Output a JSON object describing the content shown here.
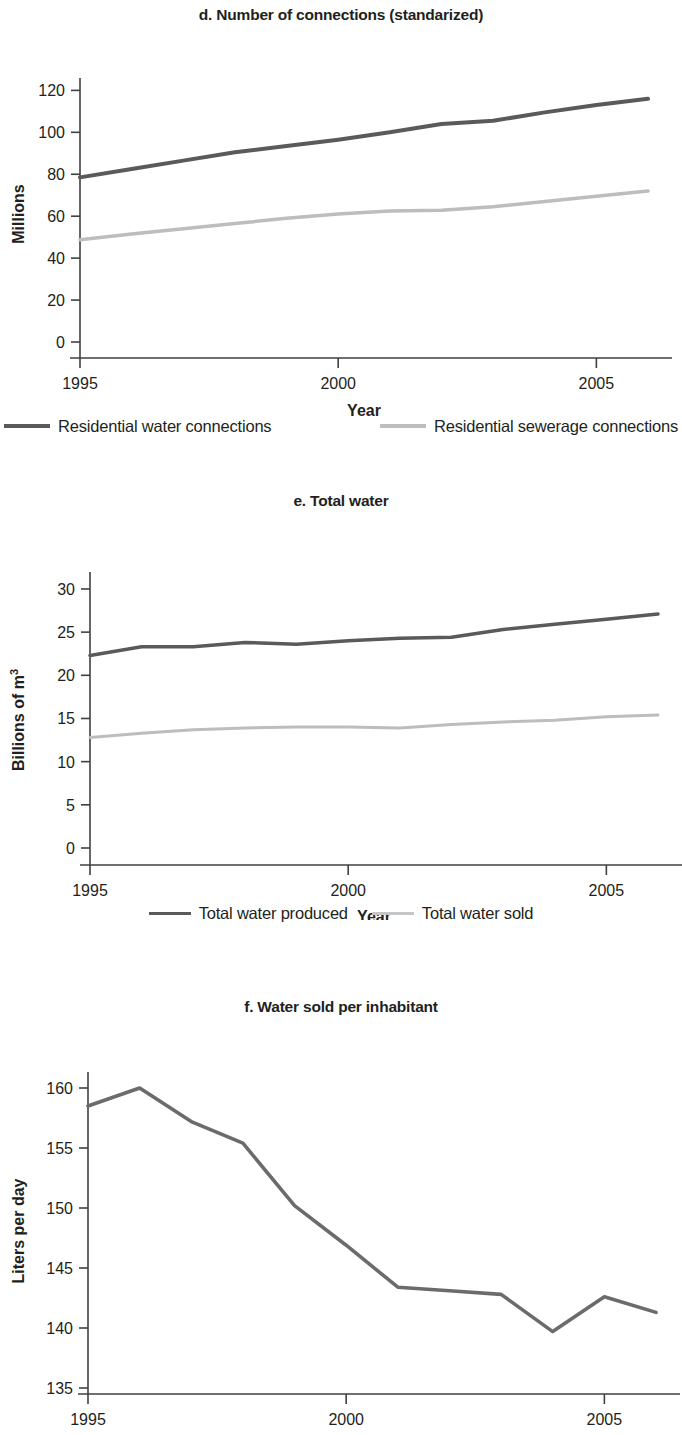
{
  "figure": {
    "shared_xlabel": "Year",
    "colors": {
      "dark": "#5a5a5a",
      "light": "#bdbdbd",
      "axis": "#404040",
      "text": "#231f20"
    }
  },
  "chart_data": [
    {
      "id": "d",
      "type": "line",
      "title": "d. Number of connections (standarized)",
      "xlabel": "Year",
      "ylabel": "Millions",
      "xlim": [
        1995,
        2006
      ],
      "ylim": [
        0,
        124
      ],
      "xticks": [
        1995,
        2000,
        2005
      ],
      "xtick_labels": [
        "1995",
        "2000",
        "2005"
      ],
      "yticks": [
        0,
        20,
        40,
        60,
        80,
        100,
        120
      ],
      "ytick_labels": [
        "0",
        "20",
        "40",
        "60",
        "80",
        "100",
        "120"
      ],
      "grid": false,
      "legend_position": "below",
      "x": [
        1995,
        1996,
        1997,
        1998,
        1999,
        2000,
        2001,
        2002,
        2003,
        2004,
        2005,
        2006
      ],
      "series": [
        {
          "name": "Residential water connections",
          "color": "#5a5a5a",
          "width": 4,
          "values": [
            78.5,
            82.5,
            86.5,
            90.5,
            93.5,
            96.5,
            100.0,
            104.0,
            105.5,
            109.5,
            113.0,
            116.0
          ]
        },
        {
          "name": "Residential sewerage connections",
          "color": "#bdbdbd",
          "width": 3.5,
          "values": [
            48.8,
            51.5,
            54.0,
            56.5,
            59.0,
            61.0,
            62.5,
            62.8,
            64.5,
            67.0,
            69.5,
            72.0
          ]
        }
      ]
    },
    {
      "id": "e",
      "type": "line",
      "title": "e. Total water",
      "xlabel": "Year",
      "ylabel": "Billions of m",
      "ylabel_superscript": "3",
      "xlim": [
        1995,
        2006
      ],
      "ylim": [
        0,
        31.5
      ],
      "xticks": [
        1995,
        2000,
        2005
      ],
      "xtick_labels": [
        "1995",
        "2000",
        "2005"
      ],
      "yticks": [
        0,
        5,
        10,
        15,
        20,
        25,
        30
      ],
      "ytick_labels": [
        "0",
        "5",
        "10",
        "15",
        "20",
        "25",
        "30"
      ],
      "grid": false,
      "legend_position": "below",
      "x": [
        1995,
        1996,
        1997,
        1998,
        1999,
        2000,
        2001,
        2002,
        2003,
        2004,
        2005,
        2006
      ],
      "series": [
        {
          "name": "Total water produced",
          "color": "#5a5a5a",
          "width": 3.5,
          "values": [
            22.3,
            23.3,
            23.3,
            23.8,
            23.6,
            24.0,
            24.3,
            24.4,
            25.3,
            25.9,
            26.5,
            27.1
          ]
        },
        {
          "name": "Total water sold",
          "color": "#bdbdbd",
          "width": 3,
          "values": [
            12.8,
            13.3,
            13.7,
            13.9,
            14.0,
            14.0,
            13.9,
            14.3,
            14.6,
            14.8,
            15.2,
            15.4
          ]
        }
      ]
    },
    {
      "id": "f",
      "type": "line",
      "title": "f. Water sold per inhabitant",
      "xlabel": "Year",
      "ylabel": "Liters per day",
      "xlim": [
        1995,
        2006
      ],
      "ylim": [
        134.5,
        161
      ],
      "xticks": [
        1995,
        2000,
        2005
      ],
      "xtick_labels": [
        "1995",
        "2000",
        "2005"
      ],
      "yticks": [
        135,
        140,
        145,
        150,
        155,
        160
      ],
      "ytick_labels": [
        "135",
        "140",
        "145",
        "150",
        "155",
        "160"
      ],
      "grid": false,
      "legend_position": "none",
      "x": [
        1995,
        1996,
        1997,
        1998,
        1999,
        2000,
        2001,
        2002,
        2003,
        2004,
        2005,
        2006
      ],
      "series": [
        {
          "name": "Water sold per inhabitant",
          "color": "#6b6b6b",
          "width": 3.6,
          "values": [
            158.5,
            160.0,
            157.2,
            155.4,
            150.2,
            146.9,
            143.4,
            143.1,
            142.8,
            139.7,
            142.6,
            141.3
          ]
        }
      ]
    }
  ]
}
